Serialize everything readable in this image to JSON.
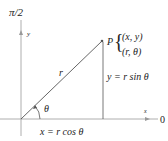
{
  "labels": {
    "pole_axis": "π/2",
    "y_axis": "y",
    "x_axis": "x",
    "polar_axis": "0",
    "point": "P",
    "cartesian": "(x, y)",
    "polar": "(r, θ)",
    "radius": "r",
    "angle": "θ",
    "y_eq": "y = r sin θ",
    "x_eq": "x = r cos θ"
  },
  "colors": {
    "axis": "#888888",
    "line": "#555555",
    "text": "#222222"
  }
}
